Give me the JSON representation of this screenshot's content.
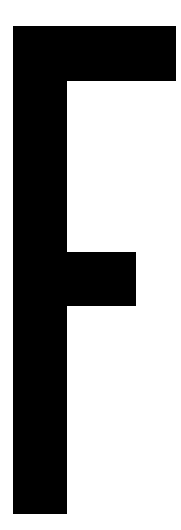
{
  "glyph": {
    "letter": "F",
    "color": "#000000",
    "background": "#ffffff"
  }
}
